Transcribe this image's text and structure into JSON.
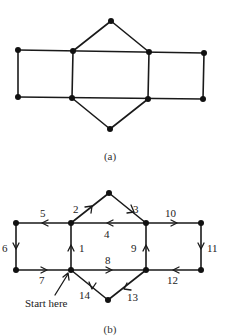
{
  "figure_a": {
    "caption": "(a)",
    "vertices": [
      {
        "id": "top",
        "x": 111,
        "y": 21
      },
      {
        "id": "ul1",
        "x": 18,
        "y": 50
      },
      {
        "id": "ul2",
        "x": 73,
        "y": 51
      },
      {
        "id": "ul3",
        "x": 149,
        "y": 52
      },
      {
        "id": "ul4",
        "x": 204,
        "y": 53
      },
      {
        "id": "ll1",
        "x": 18,
        "y": 97
      },
      {
        "id": "ll2",
        "x": 72,
        "y": 98
      },
      {
        "id": "ll3",
        "x": 148,
        "y": 99
      },
      {
        "id": "ll4",
        "x": 203,
        "y": 99
      },
      {
        "id": "bot",
        "x": 110,
        "y": 129
      }
    ]
  },
  "figure_b": {
    "caption": "(b)",
    "start_label": "Start here",
    "edge_labels": {
      "e1": "1",
      "e2": "2",
      "e3": "3",
      "e4": "4",
      "e5": "5",
      "e6": "6",
      "e7": "7",
      "e8": "8",
      "e9": "9",
      "e10": "10",
      "e11": "11",
      "e12": "12",
      "e13": "13",
      "e14": "14"
    }
  }
}
